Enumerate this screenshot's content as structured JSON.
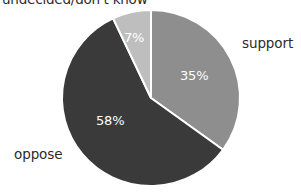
{
  "chart_data": {
    "type": "pie",
    "title": "undecided/don't know",
    "categories": [
      "support",
      "oppose",
      "undecided/don't know"
    ],
    "values": [
      35,
      58,
      7
    ],
    "value_labels": [
      "35%",
      "58%",
      "7%"
    ],
    "unit": "%",
    "start_angle_deg": 0,
    "direction": "clockwise",
    "legend": "none",
    "grid": false,
    "colors": [
      "#8e8e8e",
      "#3a3a3a",
      "#bebebe"
    ],
    "slice_label_color": "#ffffff",
    "slice_border_color": "#ffffff",
    "background": "#ffffff",
    "slices": [
      {
        "name": "support",
        "value": 35,
        "label": "35%",
        "color": "#8e8e8e",
        "start_deg": 0,
        "end_deg": 126
      },
      {
        "name": "oppose",
        "value": 58,
        "label": "58%",
        "color": "#3a3a3a",
        "start_deg": 126,
        "end_deg": 334.8
      },
      {
        "name": "undecided/don't know",
        "value": 7,
        "label": "7%",
        "color": "#bebebe",
        "start_deg": 334.8,
        "end_deg": 360
      }
    ]
  },
  "labels": {
    "title": "undecided/don't know",
    "support": "support",
    "oppose": "oppose",
    "pct_support": "35%",
    "pct_oppose": "58%",
    "pct_undecided": "7%"
  }
}
